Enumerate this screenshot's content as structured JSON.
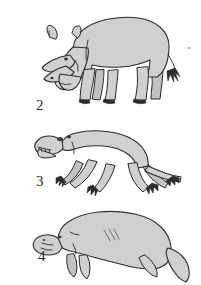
{
  "plate": {
    "background_color": "#ffffff",
    "width": 201,
    "height": 285,
    "ink_color": "#2b2b2b",
    "body_fill_color": "#d0d0d0",
    "shadow_fill_color": "#bcbcbc",
    "eye_color": "#3a3a3a"
  },
  "figures": [
    {
      "label": "2",
      "subject": "rhinoceros",
      "description": "Large quadruped mammal with a nasal horn, head lowered, thick legs with hoofed toes, short tufted tail"
    },
    {
      "label": "3",
      "subject": "lizard-like-quadruped",
      "description": "Low-slung sprawling quadruped with open mouth showing teeth, long tapering tail, clawed feet"
    },
    {
      "label": "4",
      "subject": "manatee",
      "description": "Rounded aquatic mammal with blunt snout, two front flippers, broad paddle tail, three diagonal body creases"
    }
  ],
  "marks": [
    {
      "name": "speck",
      "x": 188,
      "y": 47
    }
  ]
}
